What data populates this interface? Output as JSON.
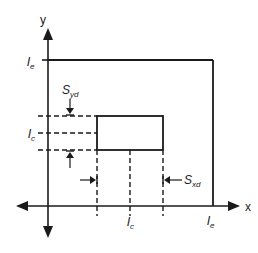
{
  "diagram": {
    "axes": {
      "x_label": "x",
      "y_label": "y"
    },
    "labels": {
      "le_y": {
        "main": "l",
        "sub": "e"
      },
      "le_x": {
        "main": "l",
        "sub": "e"
      },
      "lc_y": {
        "main": "l",
        "sub": "c"
      },
      "lc_x": {
        "main": "l",
        "sub": "c"
      },
      "syd": {
        "main": "S",
        "sub": "yd"
      },
      "sxd": {
        "main": "S",
        "sub": "xd"
      }
    },
    "colors": {
      "stroke": "#1a1a1a",
      "background": "#ffffff"
    }
  }
}
